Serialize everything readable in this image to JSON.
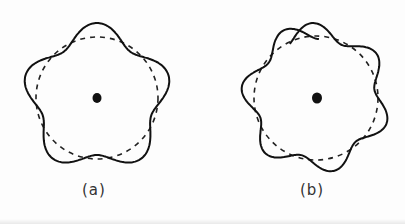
{
  "figure": {
    "panels": [
      {
        "id": "a",
        "label": "(a)",
        "lobes": 5,
        "description": "Closed wavy standing-wave orbit (solid) around nucleus, with circular reference orbit (dashed)"
      },
      {
        "id": "b",
        "label": "(b)",
        "lobes": 6,
        "description": "Non-closing wavy orbit (solid, ends overlap at top) around nucleus, with circular reference orbit (dashed)"
      }
    ]
  }
}
